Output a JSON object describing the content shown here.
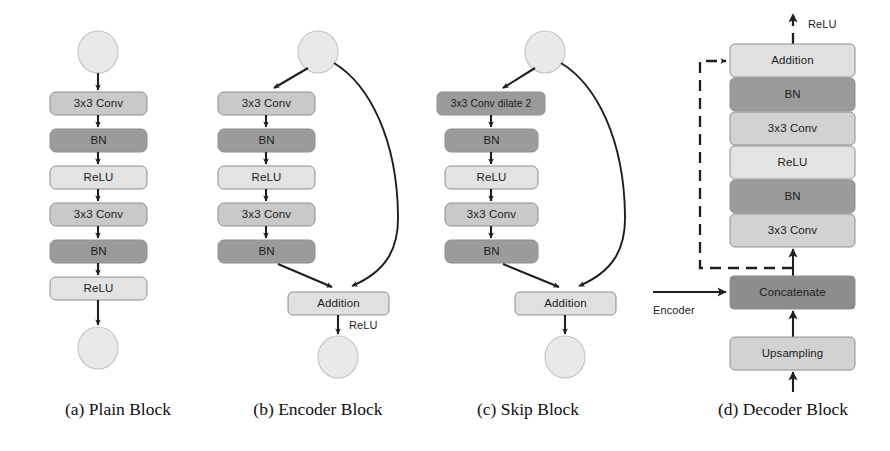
{
  "figure": {
    "background_color": "#ffffff",
    "palette": {
      "conv": "#c9c9c9",
      "bn": "#9b9b9b",
      "relu": "#e3e3e3",
      "addition": "#e0e0e0",
      "concatenate": "#8d8d8d",
      "upsampling": "#d2d2d2",
      "dilated_conv": "#9b9b9b",
      "circle": "#e9e9e9",
      "arrow": "#1f1f1f",
      "text": "#1c1c1c"
    },
    "panels": [
      {
        "id": "plain-block",
        "caption": "(a) Plain Block",
        "caption_x": 118,
        "caption_y": 411,
        "has_input_circle": true,
        "has_output_circle": true,
        "has_skip": false,
        "skip_relu_label": "",
        "nodes": [
          {
            "label": "3x3 Conv",
            "type": "conv"
          },
          {
            "label": "BN",
            "type": "bn"
          },
          {
            "label": "ReLU",
            "type": "relu"
          },
          {
            "label": "3x3 Conv",
            "type": "conv"
          },
          {
            "label": "BN",
            "type": "bn"
          },
          {
            "label": "ReLU",
            "type": "relu"
          }
        ]
      },
      {
        "id": "encoder-block",
        "caption": "(b) Encoder Block",
        "caption_x": 318,
        "caption_y": 411,
        "has_input_circle": true,
        "has_output_circle": true,
        "has_skip": true,
        "skip_relu_label": "ReLU",
        "addition_label": "Addition",
        "nodes": [
          {
            "label": "3x3 Conv",
            "type": "conv"
          },
          {
            "label": "BN",
            "type": "bn"
          },
          {
            "label": "ReLU",
            "type": "relu"
          },
          {
            "label": "3x3 Conv",
            "type": "conv"
          },
          {
            "label": "BN",
            "type": "bn"
          }
        ]
      },
      {
        "id": "skip-block",
        "caption": "(c) Skip Block",
        "caption_x": 528,
        "caption_y": 411,
        "has_input_circle": true,
        "has_output_circle": true,
        "has_skip": true,
        "skip_relu_label": "",
        "addition_label": "Addition",
        "nodes": [
          {
            "label": "3x3 Conv dilate 2",
            "type": "dilated_conv"
          },
          {
            "label": "BN",
            "type": "bn"
          },
          {
            "label": "ReLU",
            "type": "relu"
          },
          {
            "label": "3x3 Conv",
            "type": "conv"
          },
          {
            "label": "BN",
            "type": "bn"
          }
        ]
      },
      {
        "id": "decoder-block",
        "caption": "(d) Decoder Block",
        "caption_x": 783,
        "caption_y": 411,
        "output_relu_label": "ReLU",
        "encoder_input_label": "Encoder",
        "stack_top_to_bottom": [
          {
            "label": "Addition",
            "type": "addition"
          },
          {
            "label": "BN",
            "type": "bn"
          },
          {
            "label": "3x3 Conv",
            "type": "conv"
          },
          {
            "label": "ReLU",
            "type": "relu"
          },
          {
            "label": "BN",
            "type": "bn"
          },
          {
            "label": "3x3 Conv",
            "type": "conv"
          },
          {
            "label": "Concatenate",
            "type": "concatenate"
          },
          {
            "label": "Upsampling",
            "type": "upsampling"
          }
        ]
      }
    ]
  }
}
